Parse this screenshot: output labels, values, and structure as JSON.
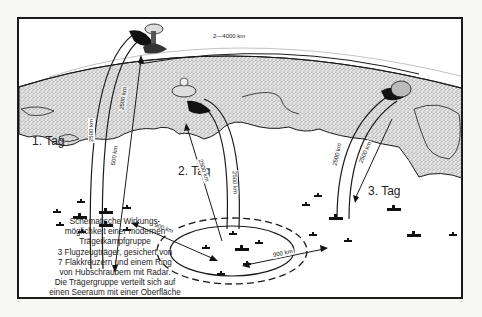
{
  "diagram": {
    "type": "schematic illustration",
    "days": [
      {
        "label": "1. Tag"
      },
      {
        "label": "2. Tag"
      },
      {
        "label": "3. Tag"
      }
    ],
    "distances": {
      "arc_day1": "2500 km",
      "line_day1_upper": "2500 km",
      "line_day1_lower": "500 km",
      "horizon": "2—4000 km",
      "arc_day2": "2500 km",
      "line_day2": "2500 km",
      "arc_day3": "2500 km",
      "line_day3": "2500 km",
      "move_1_to_2": "900 km",
      "move_2_to_3": "900 km"
    },
    "caption": [
      "Schematische Wirkungs-",
      "möglichkeit einer modernen",
      "Trägerkampfgruppe",
      "3 Flugzeugträger, gesichert von",
      "7 Flakkreuzern und einem Ring",
      "von Hubschraubern mit Radar.",
      "Die Trägergruppe verteilt sich auf",
      "einen Seeraum mit einer Oberfläche",
      "gleich der halben Bundesrepublik."
    ],
    "colors": {
      "ink": "#1a1a1a",
      "land_stipple": "#8a8a8a",
      "paper": "#ffffff"
    }
  }
}
